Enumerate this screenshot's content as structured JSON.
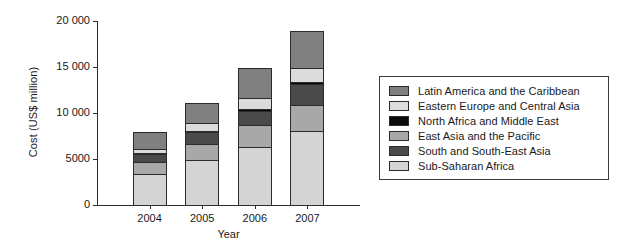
{
  "chart_data": {
    "type": "bar",
    "stacked": true,
    "title": "",
    "xlabel": "Year",
    "ylabel": "Cost (US$ million)",
    "categories": [
      "2004",
      "2005",
      "2006",
      "2007"
    ],
    "ylim": [
      0,
      20000
    ],
    "yticks": [
      0,
      5000,
      10000,
      15000,
      20000
    ],
    "ytick_labels": [
      "0",
      "5000",
      "10 000",
      "15 000",
      "20 000"
    ],
    "grid": false,
    "legend_position": "right",
    "stack_order_bottom_to_top": [
      "Sub-Saharan Africa",
      "East Asia and the Pacific",
      "South and South-East Asia",
      "North Africa and Middle East",
      "Eastern Europe and Central Asia",
      "Latin America and the Caribbean"
    ],
    "series": [
      {
        "name": "Sub-Saharan Africa",
        "color": "#d4d4d4",
        "values": [
          3500,
          4950,
          6400,
          8100
        ]
      },
      {
        "name": "South and South-East Asia",
        "color": "#4a4a4a",
        "values": [
          1000,
          1400,
          1700,
          2400
        ]
      },
      {
        "name": "East Asia and the Pacific",
        "color": "#a8a8a8",
        "values": [
          1400,
          1950,
          2500,
          3000
        ]
      },
      {
        "name": "North Africa and Middle East",
        "color": "#0a0a0a",
        "values": [
          150,
          200,
          250,
          300
        ]
      },
      {
        "name": "Eastern Europe and Central Asia",
        "color": "#dcdcdc",
        "values": [
          550,
          900,
          1350,
          1650
        ]
      },
      {
        "name": "Latin America and the Caribbean",
        "color": "#808080",
        "values": [
          1900,
          2300,
          3300,
          4100
        ]
      }
    ],
    "totals": [
      8500,
      11700,
      15300,
      19550
    ]
  },
  "legend": {
    "items": [
      {
        "label": "Latin America and the Caribbean",
        "color": "#808080"
      },
      {
        "label": "Eastern Europe and Central Asia",
        "color": "#dcdcdc"
      },
      {
        "label": "North Africa and Middle East",
        "color": "#0a0a0a"
      },
      {
        "label": "East Asia and the Pacific",
        "color": "#a8a8a8"
      },
      {
        "label": "South and South-East Asia",
        "color": "#4a4a4a"
      },
      {
        "label": "Sub-Saharan Africa",
        "color": "#d4d4d4"
      }
    ]
  }
}
